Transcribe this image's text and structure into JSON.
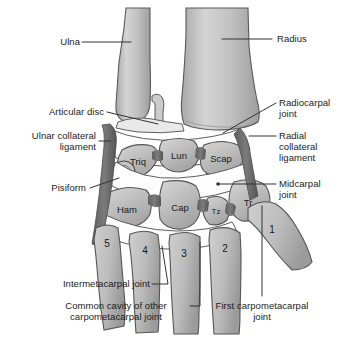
{
  "figure": {
    "background_color": "#ffffff",
    "bone_fill": "#b9b9b9",
    "bone_outline": "#4c4c4c",
    "ligament_color": "#6b6b6b",
    "cavity_color": "#ffffff",
    "leader_color": "#333333",
    "text_color": "#1b1b1b"
  },
  "callouts": {
    "left": [
      {
        "id": "ulna",
        "text": "Ulna"
      },
      {
        "id": "articular-disc",
        "text": "Articular disc"
      },
      {
        "id": "ulnar-collateral-ligament",
        "text": "Ulnar collateral\nligament"
      },
      {
        "id": "pisiform",
        "text": "Pisiform"
      }
    ],
    "right": [
      {
        "id": "radius",
        "text": "Radius"
      },
      {
        "id": "radiocarpal-joint",
        "text": "Radiocarpal\njoint"
      },
      {
        "id": "radial-collateral-ligament",
        "text": "Radial\ncollateral\nligament"
      },
      {
        "id": "midcarpal-joint",
        "text": "Midcarpal\njoint"
      }
    ],
    "bottom": [
      {
        "id": "intermetacarpal-joint",
        "text": "Intermetacarpal joint"
      },
      {
        "id": "common-cavity",
        "text": "Common cavity of other\ncarpometacarpal joint"
      },
      {
        "id": "first-carpometacarpal-joint",
        "text": "First carpometacarpal\njoint"
      }
    ]
  },
  "carpal_bones": [
    {
      "id": "triquetral",
      "abbr": "Triq",
      "full_name": "Triquetral"
    },
    {
      "id": "lunate",
      "abbr": "Lun",
      "full_name": "Lunate"
    },
    {
      "id": "scaphoid",
      "abbr": "Scap",
      "full_name": "Scaphoid"
    },
    {
      "id": "hamate",
      "abbr": "Ham",
      "full_name": "Hamate"
    },
    {
      "id": "capitate",
      "abbr": "Cap",
      "full_name": "Capitate"
    },
    {
      "id": "trapezoid",
      "abbr": "Tz",
      "full_name": "Trapezoid"
    },
    {
      "id": "trapezium",
      "abbr": "Tr",
      "full_name": "Trapezium"
    }
  ],
  "metacarpals": [
    {
      "id": "metacarpal-5",
      "number": "5"
    },
    {
      "id": "metacarpal-4",
      "number": "4"
    },
    {
      "id": "metacarpal-3",
      "number": "3"
    },
    {
      "id": "metacarpal-2",
      "number": "2"
    },
    {
      "id": "metacarpal-1",
      "number": "1"
    }
  ]
}
